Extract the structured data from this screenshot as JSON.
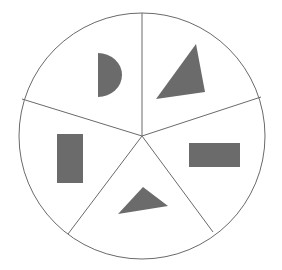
{
  "diagram": {
    "type": "divided-circle",
    "colors": {
      "background": "#ffffff",
      "stroke": "#6a6a6a",
      "fill": "#6b6b6b"
    },
    "circle": {
      "cx": 142,
      "cy": 136,
      "r": 123
    },
    "dividers": [
      {
        "x2": 142,
        "y2": 13
      },
      {
        "x2": 261,
        "y2": 97
      },
      {
        "x2": 213,
        "y2": 232
      },
      {
        "x2": 68,
        "y2": 234
      },
      {
        "x2": 22,
        "y2": 99
      }
    ],
    "sectors": [
      {
        "name": "top-left",
        "shape": "semicircle"
      },
      {
        "name": "top-right",
        "shape": "triangle"
      },
      {
        "name": "right",
        "shape": "horizontal-rectangle"
      },
      {
        "name": "bottom",
        "shape": "triangle"
      },
      {
        "name": "left",
        "shape": "vertical-rectangle"
      }
    ]
  }
}
